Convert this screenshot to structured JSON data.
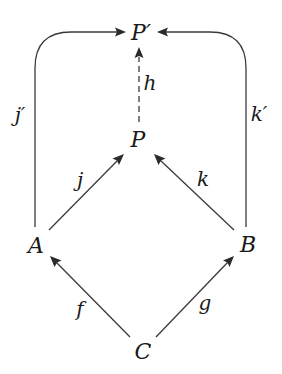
{
  "diagram": {
    "type": "commutative-diagram",
    "colors": {
      "stroke": "#3a3a3a",
      "text": "#1a1a1a",
      "background": "#ffffff"
    },
    "nodes": [
      {
        "id": "Pprime",
        "label": "P′",
        "x": 141,
        "y": 40
      },
      {
        "id": "P",
        "label": "P",
        "x": 138,
        "y": 147
      },
      {
        "id": "A",
        "label": "A",
        "x": 36,
        "y": 254
      },
      {
        "id": "B",
        "label": "B",
        "x": 248,
        "y": 253
      },
      {
        "id": "C",
        "label": "C",
        "x": 143,
        "y": 360
      }
    ],
    "edges": [
      {
        "id": "jprime",
        "from": "A",
        "to": "Pprime",
        "label": "j′",
        "style": "solid",
        "shape": "rounded-corner"
      },
      {
        "id": "kprime",
        "from": "B",
        "to": "Pprime",
        "label": "k′",
        "style": "solid",
        "shape": "rounded-corner"
      },
      {
        "id": "h",
        "from": "P",
        "to": "Pprime",
        "label": "h",
        "style": "dashed",
        "shape": "straight"
      },
      {
        "id": "j",
        "from": "A",
        "to": "P",
        "label": "j",
        "style": "solid",
        "shape": "straight"
      },
      {
        "id": "k",
        "from": "B",
        "to": "P",
        "label": "k",
        "style": "solid",
        "shape": "straight"
      },
      {
        "id": "f",
        "from": "C",
        "to": "A",
        "label": "f",
        "style": "solid",
        "shape": "straight"
      },
      {
        "id": "g",
        "from": "C",
        "to": "B",
        "label": "g",
        "style": "solid",
        "shape": "straight"
      }
    ],
    "labels": {
      "Pprime": "P′",
      "P": "P",
      "A": "A",
      "B": "B",
      "C": "C",
      "jprime": "j′",
      "kprime": "k′",
      "h": "h",
      "j": "j",
      "k": "k",
      "f": "f",
      "g": "g"
    }
  }
}
